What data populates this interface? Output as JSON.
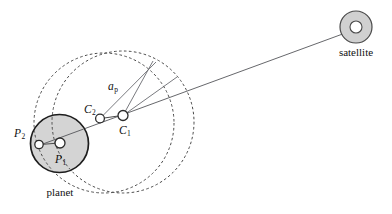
{
  "figure": {
    "background_color": "#ffffff",
    "width": 392,
    "height": 214
  },
  "labels": {
    "planet": "planet",
    "satellite": "satellite",
    "p1": "P",
    "p1_sub": "1",
    "p2": "P",
    "p2_sub": "2",
    "c1": "C",
    "c1_sub": "1",
    "c2": "C",
    "c2_sub": "2",
    "a_p": "a",
    "a_p_sub": "p"
  },
  "colors": {
    "planet_fill": "#d4d4d4",
    "planet_stroke": "#1d1d1d",
    "satellite_fill": "#d0d0d0",
    "satellite_core_fill": "#ffffff",
    "orbit_dash_stroke": "#4a4a4a",
    "sight_line_stroke": "#55565a",
    "node_fill": "#ffffff",
    "node_stroke": "#2b2b2b",
    "text": "#111111"
  },
  "geometry": {
    "planet": {
      "cx": 59.5,
      "cy": 143.5,
      "r": 29.0
    },
    "satellite": {
      "cx": 356.0,
      "cy": 27.0,
      "r_outer": 16.0,
      "r_inner": 6.0
    },
    "nodes": {
      "P1": {
        "cx": 60.0,
        "cy": 143.0,
        "r": 5.0
      },
      "P2": {
        "cx": 39.0,
        "cy": 144.5,
        "r": 4.2
      },
      "C1": {
        "cx": 123.0,
        "cy": 115.5,
        "r": 5.0
      },
      "C2": {
        "cx": 100.0,
        "cy": 118.5,
        "r": 4.4
      }
    },
    "orbits": [
      {
        "name": "orbit-about-C1",
        "cx": 123.0,
        "cy": 122.0,
        "r": 71.0
      },
      {
        "name": "orbit-about-C2",
        "cx": 104.0,
        "cy": 123.0,
        "r": 70.0
      }
    ],
    "sight_line": {
      "x1": 36.0,
      "y1": 146.5,
      "x2": 344.0,
      "y2": 33.5
    },
    "radius_lines": [
      {
        "name": "ap-radius-from-C2",
        "x1": 100.0,
        "y1": 118.5,
        "x2": 156.0,
        "y2": 62.0
      },
      {
        "name": "radius-from-C1-upper",
        "x1": 123.0,
        "y1": 115.5,
        "x2": 153.0,
        "y2": 61.0
      },
      {
        "name": "radius-from-C1-lower",
        "x1": 123.0,
        "y1": 115.5,
        "x2": 177.0,
        "y2": 77.0
      }
    ],
    "link_lines": [
      {
        "name": "P2-to-P1",
        "x1": 43.0,
        "y1": 144.3,
        "x2": 55.5,
        "y2": 143.3
      },
      {
        "name": "C2-to-C1",
        "x1": 104.3,
        "y1": 118.0,
        "x2": 118.2,
        "y2": 116.0
      }
    ]
  },
  "label_positions": {
    "planet": {
      "x": 60.0,
      "y": 196.0
    },
    "satellite": {
      "x": 356.0,
      "y": 56.0
    },
    "p1": {
      "x": 55.0,
      "y": 163.0
    },
    "p2": {
      "x": 14.0,
      "y": 137.0
    },
    "c1": {
      "x": 119.0,
      "y": 134.0
    },
    "c2": {
      "x": 84.0,
      "y": 113.0
    },
    "a_p": {
      "x": 108.0,
      "y": 90.0
    }
  }
}
